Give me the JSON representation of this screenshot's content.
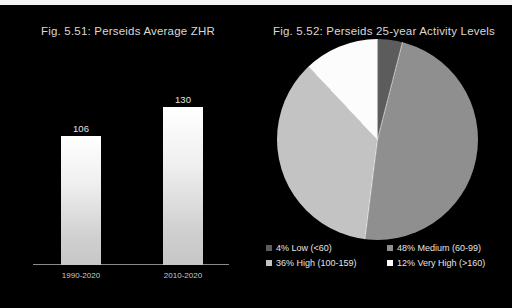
{
  "figure": {
    "background": "#000000",
    "top_strip_color": "#f3f3f3"
  },
  "chart_data": [
    {
      "type": "bar",
      "title": "Fig. 5.51: Perseids Average ZHR",
      "categories": [
        "1990-2020",
        "2010-2020"
      ],
      "values": [
        106,
        130
      ],
      "value_labels": [
        "106",
        "130"
      ],
      "xlabel": "",
      "ylabel": "",
      "ylim": [
        0,
        170
      ],
      "grid": false,
      "legend": "none",
      "bar_color": "#eeeeee"
    },
    {
      "type": "pie",
      "title": "Fig. 5.52: Perseids 25-year Activity Levels",
      "labels": [
        "Low (<60)",
        "Medium (60-99)",
        "High (100-159)",
        "Very High (>160)"
      ],
      "values": [
        4,
        48,
        36,
        12
      ],
      "legend_entries": [
        "4% Low (<60)",
        "48% Medium (60-99)",
        "36% High (100-159)",
        "12% Very High (>160)"
      ],
      "colors": [
        "#5c5c5c",
        "#8f8f8f",
        "#c3c3c3",
        "#fcfcfc"
      ],
      "legend_position": "bottom",
      "start_angle_deg": 0
    }
  ]
}
